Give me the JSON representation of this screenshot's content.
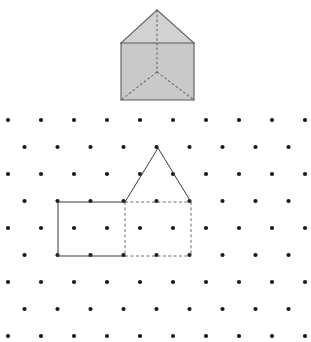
{
  "page": {
    "width": 311,
    "height": 342,
    "background": "#ffffff"
  },
  "colors": {
    "ink": "#2b2b2b",
    "dot": "#1a1a1a",
    "prism_fill": "#c9c9c9",
    "prism_fill_light": "#d6d6d6",
    "prism_stroke": "#5a5a5a",
    "hidden_stroke": "#6b6b6b",
    "solid_stroke": "#3a3a3a"
  },
  "prism": {
    "name": "house-shaped-prism",
    "description": "Shaded pentagonal (house) prism with dashed hidden edges",
    "apex": [
      157,
      10
    ],
    "roof_left": [
      121,
      43
    ],
    "roof_right": [
      194,
      43
    ],
    "box_bottom_left": [
      121,
      100
    ],
    "box_bottom_right": [
      194,
      100
    ],
    "inner_center": [
      157,
      72
    ],
    "faces": [
      {
        "id": "roof-face",
        "points": "157,10 121,43 194,43",
        "fill": "#d2d2d2"
      },
      {
        "id": "front-face",
        "points": "121,43 194,43 194,100 121,100",
        "fill": "#c9c9c9"
      }
    ],
    "solid_edges": [
      {
        "id": "roof-left-edge",
        "x1": 157,
        "y1": 10,
        "x2": 121,
        "y2": 43
      },
      {
        "id": "roof-right-edge",
        "x1": 157,
        "y1": 10,
        "x2": 194,
        "y2": 43
      },
      {
        "id": "roof-base-edge",
        "x1": 121,
        "y1": 43,
        "x2": 194,
        "y2": 43
      },
      {
        "id": "box-left-edge",
        "x1": 121,
        "y1": 43,
        "x2": 121,
        "y2": 100
      },
      {
        "id": "box-right-edge",
        "x1": 194,
        "y1": 43,
        "x2": 194,
        "y2": 100
      },
      {
        "id": "box-bottom-edge",
        "x1": 121,
        "y1": 100,
        "x2": 194,
        "y2": 100
      }
    ],
    "hidden_edges": [
      {
        "id": "hidden-vertical-apex",
        "x1": 157,
        "y1": 10,
        "x2": 157,
        "y2": 72
      },
      {
        "id": "hidden-diagonal-left",
        "x1": 157,
        "y1": 72,
        "x2": 121,
        "y2": 100
      },
      {
        "id": "hidden-diagonal-right",
        "x1": 157,
        "y1": 72,
        "x2": 194,
        "y2": 100
      }
    ]
  },
  "dot_grid": {
    "name": "isometric-dot-grid",
    "rows": 9,
    "row_spacing": 27,
    "col_spacing": 33,
    "offset_odd_rows": 16.5,
    "dot_radius": 2.1,
    "first_row_y": 120,
    "first_col_x": 8,
    "cols_even": 10,
    "cols_odd": 9
  },
  "house_drawing": {
    "name": "house-outline-drawing",
    "description": "Two dimensional house drawn on the dot grid with solid front edges and dashed hidden edges",
    "apex": [
      158,
      148
    ],
    "roof_left": [
      125,
      202
    ],
    "roof_right": [
      191,
      202
    ],
    "front_top_left": [
      58,
      202
    ],
    "front_bottom_left": [
      58,
      256
    ],
    "front_bottom_mid": [
      125,
      256
    ],
    "back_bottom_right": [
      191,
      256
    ],
    "solid_edges": [
      {
        "id": "roof-left-slope",
        "x1": 158,
        "y1": 148,
        "x2": 125,
        "y2": 202
      },
      {
        "id": "roof-right-slope",
        "x1": 158,
        "y1": 148,
        "x2": 191,
        "y2": 202
      },
      {
        "id": "front-top-edge",
        "x1": 58,
        "y1": 202,
        "x2": 125,
        "y2": 202
      },
      {
        "id": "front-left-edge",
        "x1": 58,
        "y1": 202,
        "x2": 58,
        "y2": 256
      },
      {
        "id": "front-bottom-edge",
        "x1": 58,
        "y1": 256,
        "x2": 125,
        "y2": 256
      }
    ],
    "hidden_edges": [
      {
        "id": "hidden-top-edge",
        "x1": 125,
        "y1": 202,
        "x2": 191,
        "y2": 202
      },
      {
        "id": "hidden-mid-vertical",
        "x1": 125,
        "y1": 202,
        "x2": 125,
        "y2": 256
      },
      {
        "id": "hidden-right-vertical",
        "x1": 191,
        "y1": 202,
        "x2": 191,
        "y2": 256
      },
      {
        "id": "hidden-bottom-edge",
        "x1": 125,
        "y1": 256,
        "x2": 191,
        "y2": 256
      }
    ]
  }
}
